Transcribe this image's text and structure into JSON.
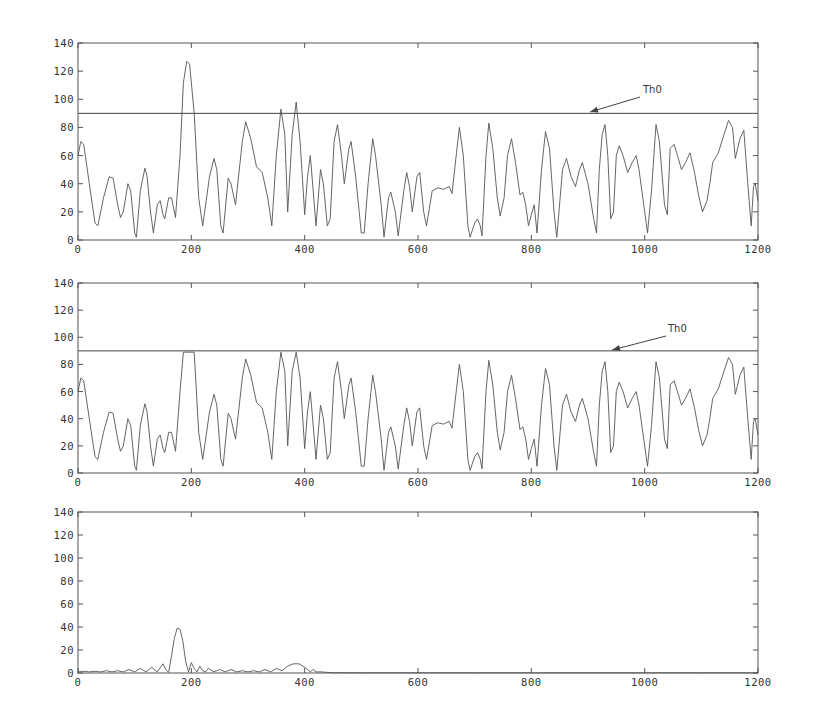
{
  "chart_data": [
    {
      "type": "line",
      "title": "",
      "xlabel": "",
      "ylabel": "",
      "xlim": [
        0,
        1200
      ],
      "ylim": [
        0,
        140
      ],
      "xticks": [
        0,
        200,
        400,
        600,
        800,
        1000,
        1200
      ],
      "yticks": [
        0,
        20,
        40,
        60,
        80,
        100,
        120,
        140
      ],
      "grid": false,
      "threshold": {
        "label": "Th0",
        "value": 90
      },
      "box": {
        "left": 78,
        "top": 43,
        "right": 758,
        "bottom": 240
      },
      "annotation": {
        "text_x": 643,
        "text_y": 93,
        "arrow_from": [
          640,
          97
        ],
        "arrow_to": [
          590,
          112
        ]
      },
      "series": [
        {
          "name": "signal",
          "x": [
            0,
            5,
            10,
            20,
            30,
            35,
            45,
            55,
            62,
            70,
            75,
            80,
            88,
            93,
            100,
            103,
            110,
            118,
            122,
            128,
            133,
            140,
            145,
            150,
            153,
            160,
            165,
            172,
            180,
            186,
            192,
            197,
            205,
            213,
            220,
            232,
            240,
            245,
            252,
            256,
            265,
            270,
            278,
            290,
            296,
            305,
            315,
            325,
            335,
            342,
            350,
            358,
            365,
            370,
            378,
            385,
            392,
            400,
            405,
            410,
            415,
            420,
            428,
            433,
            440,
            445,
            452,
            458,
            465,
            470,
            478,
            482,
            490,
            500,
            505,
            512,
            520,
            525,
            535,
            540,
            548,
            552,
            560,
            565,
            575,
            580,
            585,
            590,
            598,
            603,
            610,
            615,
            625,
            635,
            645,
            655,
            660,
            668,
            673,
            680,
            688,
            692,
            700,
            705,
            710,
            713,
            720,
            725,
            732,
            740,
            745,
            752,
            758,
            765,
            772,
            780,
            785,
            790,
            795,
            800,
            805,
            810,
            818,
            825,
            832,
            840,
            845,
            855,
            862,
            870,
            878,
            885,
            890,
            900,
            910,
            915,
            920,
            925,
            930,
            935,
            940,
            945,
            950,
            955,
            962,
            970,
            978,
            985,
            990,
            1000,
            1005,
            1012,
            1020,
            1026,
            1035,
            1040,
            1045,
            1052,
            1058,
            1065,
            1072,
            1080,
            1088,
            1095,
            1102,
            1110,
            1115,
            1120,
            1130,
            1140,
            1148,
            1155,
            1160,
            1168,
            1175,
            1182,
            1188,
            1192,
            1195,
            1200
          ],
          "y": [
            60,
            70,
            68,
            40,
            12,
            10,
            30,
            45,
            44,
            25,
            16,
            20,
            40,
            35,
            5,
            2,
            35,
            51,
            45,
            20,
            5,
            25,
            28,
            18,
            15,
            30,
            30,
            16,
            60,
            112,
            127,
            125,
            90,
            30,
            10,
            45,
            58,
            50,
            10,
            5,
            44,
            40,
            25,
            70,
            84,
            72,
            52,
            48,
            30,
            10,
            60,
            93,
            75,
            20,
            75,
            98,
            70,
            18,
            45,
            60,
            35,
            10,
            50,
            40,
            10,
            15,
            70,
            82,
            60,
            40,
            65,
            70,
            45,
            5,
            5,
            40,
            72,
            60,
            25,
            2,
            30,
            34,
            20,
            3,
            35,
            48,
            38,
            20,
            45,
            48,
            20,
            10,
            35,
            37,
            36,
            38,
            33,
            62,
            80,
            60,
            10,
            2,
            12,
            15,
            10,
            3,
            60,
            83,
            65,
            30,
            17,
            30,
            60,
            72,
            55,
            32,
            34,
            25,
            10,
            18,
            25,
            5,
            50,
            77,
            65,
            20,
            2,
            50,
            58,
            45,
            38,
            50,
            55,
            40,
            15,
            5,
            50,
            75,
            82,
            60,
            15,
            20,
            60,
            67,
            60,
            48,
            55,
            60,
            50,
            20,
            5,
            35,
            82,
            70,
            25,
            18,
            65,
            68,
            60,
            50,
            55,
            62,
            48,
            32,
            20,
            28,
            40,
            55,
            62,
            75,
            85,
            80,
            58,
            72,
            78,
            40,
            10,
            38,
            40,
            28
          ]
        }
      ]
    },
    {
      "type": "line",
      "title": "",
      "xlabel": "",
      "ylabel": "",
      "xlim": [
        0,
        1200
      ],
      "ylim": [
        0,
        140
      ],
      "xticks": [
        0,
        200,
        400,
        600,
        800,
        1000,
        1200
      ],
      "yticks": [
        0,
        20,
        40,
        60,
        80,
        100,
        120,
        140
      ],
      "grid": false,
      "threshold": {
        "label": "Th0",
        "value": 90
      },
      "clip_at": 89,
      "box": {
        "left": 78,
        "top": 283,
        "right": 758,
        "bottom": 473
      },
      "annotation": {
        "text_x": 668,
        "text_y": 332,
        "arrow_from": [
          666,
          336
        ],
        "arrow_to": [
          612,
          350
        ]
      },
      "series_ref": 0
    },
    {
      "type": "line",
      "title": "",
      "xlabel": "",
      "ylabel": "",
      "xlim": [
        0,
        1200
      ],
      "ylim": [
        0,
        140
      ],
      "xticks": [
        0,
        200,
        400,
        600,
        800,
        1000,
        1200
      ],
      "yticks": [
        0,
        20,
        40,
        60,
        80,
        100,
        120,
        140
      ],
      "grid": false,
      "box": {
        "left": 78,
        "top": 512,
        "right": 758,
        "bottom": 673
      },
      "series": [
        {
          "name": "residual",
          "x": [
            0,
            10,
            20,
            30,
            40,
            50,
            60,
            70,
            80,
            90,
            100,
            110,
            120,
            130,
            140,
            150,
            155,
            160,
            165,
            170,
            175,
            180,
            185,
            190,
            195,
            200,
            205,
            210,
            215,
            220,
            225,
            230,
            240,
            250,
            260,
            270,
            280,
            290,
            300,
            310,
            320,
            330,
            340,
            350,
            360,
            370,
            380,
            390,
            400,
            410,
            415,
            420,
            430,
            440,
            450,
            500,
            600,
            700,
            800,
            900,
            1000,
            1100,
            1200
          ],
          "y": [
            1,
            1.5,
            1,
            1.5,
            1,
            2,
            1,
            2,
            1,
            3,
            1,
            4,
            1,
            5,
            1,
            8,
            3,
            0.5,
            15,
            30,
            39,
            38,
            28,
            10,
            1,
            9,
            4,
            1,
            6,
            2,
            1,
            4,
            1,
            3,
            1,
            3,
            1,
            2,
            1,
            2,
            1,
            3,
            1,
            4,
            2,
            6,
            8,
            8,
            5,
            1,
            3,
            1,
            1,
            0.5,
            0.3,
            0.2,
            0.2,
            0.2,
            0.2,
            0.2,
            0.2,
            0.2,
            0.2
          ]
        }
      ]
    }
  ]
}
